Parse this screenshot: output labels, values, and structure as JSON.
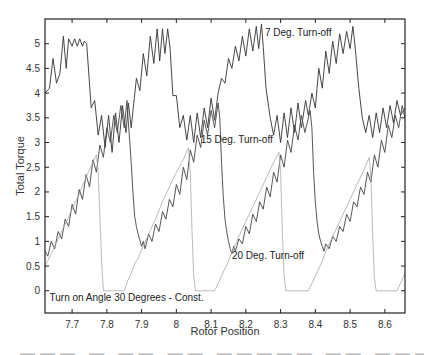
{
  "chart_data": {
    "type": "line",
    "title": "",
    "xlabel": "Rotor Position",
    "ylabel": "Total Torque",
    "xlim": [
      7.622,
      8.658
    ],
    "ylim": [
      -0.45,
      5.5
    ],
    "grid": false,
    "x_ticks": [
      7.7,
      7.8,
      7.9,
      8.0,
      8.1,
      8.2,
      8.3,
      8.4,
      8.5,
      8.6
    ],
    "x_tick_labels": [
      "7.7",
      "7.8",
      "7.9",
      "8",
      "8.1",
      "8.2",
      "8.3",
      "8.4",
      "8.5",
      "8.6"
    ],
    "y_ticks": [
      0,
      0.5,
      1,
      1.5,
      2,
      2.5,
      3,
      3.5,
      4,
      4.5,
      5
    ],
    "y_tick_labels": [
      "0",
      "0.5",
      "1",
      "1.5",
      "2",
      "2.5",
      "3",
      "3.5",
      "4",
      "4.5",
      "5"
    ],
    "annotations": [
      {
        "text": "7 Deg. Turn-off",
        "x": 8.255,
        "y": 5.15
      },
      {
        "text": "15 Deg. Turn-off",
        "x": 8.07,
        "y": 3.0
      },
      {
        "text": "20 Deg. Turn-off",
        "x": 8.16,
        "y": 0.65
      },
      {
        "text": "Turn on Angle 30 Degrees - Const.",
        "x": 7.635,
        "y": -0.2
      }
    ],
    "series": [
      {
        "name": "7 Deg. Turn-off",
        "color": "#333333",
        "width": 0.9,
        "period": 0.264,
        "description": "Periodic, rises with ripple to ~5.1-5.3 peak then drops to ~3.2 minimum",
        "points": [
          [
            7.622,
            4.0
          ],
          [
            7.635,
            4.1
          ],
          [
            7.645,
            4.7
          ],
          [
            7.655,
            4.2
          ],
          [
            7.665,
            4.4
          ],
          [
            7.675,
            5.15
          ],
          [
            7.683,
            4.5
          ],
          [
            7.69,
            5.1
          ],
          [
            7.7,
            4.95
          ],
          [
            7.707,
            5.1
          ],
          [
            7.715,
            4.95
          ],
          [
            7.722,
            5.1
          ],
          [
            7.73,
            4.95
          ],
          [
            7.735,
            5.05
          ],
          [
            7.742,
            5.0
          ],
          [
            7.755,
            3.7
          ],
          [
            7.765,
            3.85
          ],
          [
            7.775,
            3.15
          ],
          [
            7.785,
            3.55
          ],
          [
            7.795,
            2.9
          ],
          [
            7.805,
            3.55
          ],
          [
            7.815,
            2.8
          ],
          [
            7.825,
            3.6
          ],
          [
            7.835,
            3.0
          ],
          [
            7.845,
            3.75
          ],
          [
            7.855,
            3.2
          ],
          [
            7.862,
            3.8
          ],
          [
            7.87,
            3.3
          ],
          [
            7.885,
            4.3
          ],
          [
            7.895,
            4.05
          ],
          [
            7.905,
            4.8
          ],
          [
            7.915,
            4.35
          ],
          [
            7.925,
            5.15
          ],
          [
            7.935,
            4.6
          ],
          [
            7.945,
            5.3
          ],
          [
            7.952,
            4.65
          ],
          [
            7.96,
            5.3
          ],
          [
            7.967,
            4.8
          ],
          [
            7.975,
            5.3
          ],
          [
            7.982,
            4.9
          ],
          [
            7.99,
            3.95
          ],
          [
            8.0,
            3.95
          ],
          [
            8.01,
            3.3
          ],
          [
            8.02,
            3.55
          ],
          [
            8.03,
            3.05
          ],
          [
            8.04,
            3.55
          ],
          [
            8.05,
            3.0
          ],
          [
            8.06,
            3.6
          ],
          [
            8.07,
            3.1
          ],
          [
            8.08,
            3.7
          ],
          [
            8.09,
            3.3
          ],
          [
            8.1,
            3.9
          ],
          [
            8.11,
            3.45
          ],
          [
            8.12,
            4.0
          ],
          [
            8.13,
            4.3
          ],
          [
            8.14,
            4.2
          ],
          [
            8.15,
            4.7
          ],
          [
            8.16,
            4.5
          ],
          [
            8.17,
            4.95
          ],
          [
            8.18,
            4.65
          ],
          [
            8.19,
            5.15
          ],
          [
            8.2,
            4.75
          ],
          [
            8.21,
            5.3
          ],
          [
            8.22,
            4.85
          ],
          [
            8.23,
            5.35
          ],
          [
            8.237,
            4.9
          ],
          [
            8.245,
            5.4
          ],
          [
            8.25,
            4.95
          ],
          [
            8.258,
            4.1
          ],
          [
            8.27,
            3.5
          ],
          [
            8.28,
            3.15
          ],
          [
            8.29,
            3.55
          ],
          [
            8.3,
            3.0
          ],
          [
            8.31,
            3.6
          ],
          [
            8.32,
            3.1
          ],
          [
            8.33,
            3.7
          ],
          [
            8.34,
            3.2
          ],
          [
            8.35,
            3.8
          ],
          [
            8.36,
            3.3
          ],
          [
            8.372,
            3.85
          ],
          [
            8.38,
            3.55
          ],
          [
            8.39,
            4.0
          ],
          [
            8.4,
            3.7
          ],
          [
            8.41,
            4.5
          ],
          [
            8.42,
            4.1
          ],
          [
            8.43,
            4.85
          ],
          [
            8.44,
            4.4
          ],
          [
            8.45,
            5.05
          ],
          [
            8.46,
            4.6
          ],
          [
            8.47,
            5.2
          ],
          [
            8.48,
            4.8
          ],
          [
            8.49,
            5.25
          ],
          [
            8.5,
            4.9
          ],
          [
            8.508,
            5.35
          ],
          [
            8.515,
            4.9
          ],
          [
            8.525,
            4.1
          ],
          [
            8.535,
            3.5
          ],
          [
            8.545,
            3.2
          ],
          [
            8.555,
            3.55
          ],
          [
            8.565,
            3.1
          ],
          [
            8.575,
            3.6
          ],
          [
            8.585,
            3.2
          ],
          [
            8.595,
            3.7
          ],
          [
            8.605,
            3.3
          ],
          [
            8.615,
            3.75
          ],
          [
            8.625,
            3.4
          ],
          [
            8.635,
            3.85
          ],
          [
            8.645,
            3.55
          ],
          [
            8.658,
            3.7
          ]
        ]
      },
      {
        "name": "15 Deg. Turn-off",
        "color": "#444444",
        "width": 0.9,
        "period": 0.264,
        "description": "Periodic ramp from ~0.8 min to ~3.8 peak with ripple, then steep smooth drop",
        "points": [
          [
            7.622,
            0.8
          ],
          [
            7.63,
            0.7
          ],
          [
            7.64,
            1.0
          ],
          [
            7.65,
            0.85
          ],
          [
            7.66,
            1.2
          ],
          [
            7.67,
            1.05
          ],
          [
            7.68,
            1.45
          ],
          [
            7.69,
            1.3
          ],
          [
            7.7,
            1.75
          ],
          [
            7.71,
            1.55
          ],
          [
            7.72,
            2.05
          ],
          [
            7.73,
            1.85
          ],
          [
            7.74,
            2.35
          ],
          [
            7.75,
            2.1
          ],
          [
            7.76,
            2.65
          ],
          [
            7.77,
            2.4
          ],
          [
            7.78,
            2.95
          ],
          [
            7.79,
            2.7
          ],
          [
            7.8,
            3.3
          ],
          [
            7.81,
            3.0
          ],
          [
            7.82,
            3.55
          ],
          [
            7.83,
            3.2
          ],
          [
            7.84,
            3.75
          ],
          [
            7.85,
            3.3
          ],
          [
            7.858,
            3.85
          ],
          [
            7.86,
            3.6
          ],
          [
            7.87,
            2.6
          ],
          [
            7.875,
            2.0
          ],
          [
            7.88,
            1.5
          ],
          [
            7.885,
            1.3
          ],
          [
            7.89,
            1.15
          ],
          [
            7.9,
            0.9
          ],
          [
            7.905,
            1.0
          ],
          [
            7.91,
            0.85
          ],
          [
            7.92,
            1.15
          ],
          [
            7.93,
            1.0
          ],
          [
            7.94,
            1.35
          ],
          [
            7.95,
            1.2
          ],
          [
            7.96,
            1.6
          ],
          [
            7.97,
            1.45
          ],
          [
            7.98,
            1.85
          ],
          [
            7.99,
            1.7
          ],
          [
            8.0,
            2.15
          ],
          [
            8.01,
            1.95
          ],
          [
            8.02,
            2.5
          ],
          [
            8.03,
            2.25
          ],
          [
            8.04,
            2.85
          ],
          [
            8.05,
            2.6
          ],
          [
            8.06,
            3.15
          ],
          [
            8.07,
            2.9
          ],
          [
            8.08,
            3.45
          ],
          [
            8.09,
            3.15
          ],
          [
            8.1,
            3.65
          ],
          [
            8.11,
            3.3
          ],
          [
            8.12,
            3.8
          ],
          [
            8.125,
            3.5
          ],
          [
            8.13,
            2.6
          ],
          [
            8.135,
            1.9
          ],
          [
            8.14,
            1.45
          ],
          [
            8.145,
            1.2
          ],
          [
            8.15,
            1.0
          ],
          [
            8.155,
            0.85
          ],
          [
            8.16,
            0.75
          ],
          [
            8.165,
            0.9
          ],
          [
            8.17,
            0.8
          ],
          [
            8.18,
            1.05
          ],
          [
            8.19,
            0.95
          ],
          [
            8.2,
            1.3
          ],
          [
            8.21,
            1.15
          ],
          [
            8.22,
            1.55
          ],
          [
            8.23,
            1.4
          ],
          [
            8.24,
            1.8
          ],
          [
            8.25,
            1.65
          ],
          [
            8.26,
            2.1
          ],
          [
            8.27,
            1.9
          ],
          [
            8.28,
            2.4
          ],
          [
            8.29,
            2.2
          ],
          [
            8.3,
            2.75
          ],
          [
            8.31,
            2.5
          ],
          [
            8.32,
            3.05
          ],
          [
            8.33,
            2.8
          ],
          [
            8.34,
            3.35
          ],
          [
            8.35,
            3.05
          ],
          [
            8.36,
            3.55
          ],
          [
            8.37,
            3.2
          ],
          [
            8.385,
            3.65
          ],
          [
            8.39,
            3.3
          ],
          [
            8.395,
            2.4
          ],
          [
            8.4,
            1.8
          ],
          [
            8.405,
            1.4
          ],
          [
            8.41,
            1.15
          ],
          [
            8.415,
            1.0
          ],
          [
            8.42,
            0.9
          ],
          [
            8.425,
            0.8
          ],
          [
            8.43,
            0.95
          ],
          [
            8.44,
            0.85
          ],
          [
            8.45,
            1.1
          ],
          [
            8.46,
            1.0
          ],
          [
            8.47,
            1.3
          ],
          [
            8.48,
            1.2
          ],
          [
            8.49,
            1.55
          ],
          [
            8.5,
            1.4
          ],
          [
            8.51,
            1.8
          ],
          [
            8.52,
            1.7
          ],
          [
            8.53,
            2.1
          ],
          [
            8.54,
            1.95
          ],
          [
            8.55,
            2.4
          ],
          [
            8.56,
            2.2
          ],
          [
            8.57,
            2.75
          ],
          [
            8.58,
            2.5
          ],
          [
            8.59,
            3.05
          ],
          [
            8.6,
            2.8
          ],
          [
            8.61,
            3.35
          ],
          [
            8.62,
            3.1
          ],
          [
            8.63,
            3.55
          ],
          [
            8.64,
            3.3
          ],
          [
            8.65,
            3.75
          ],
          [
            8.658,
            3.5
          ]
        ]
      },
      {
        "name": "20 Deg. Turn-off",
        "color": "#aaaaaa",
        "width": 0.8,
        "period": 0.264,
        "description": "Light grey: ramp with ripple then steep drop to 0, flat zero, then stepped rise",
        "points": [
          [
            7.622,
            0.5
          ],
          [
            7.64,
            0.75
          ],
          [
            7.66,
            1.05
          ],
          [
            7.68,
            1.35
          ],
          [
            7.7,
            1.65
          ],
          [
            7.72,
            1.95
          ],
          [
            7.74,
            2.3
          ],
          [
            7.76,
            2.6
          ],
          [
            7.77,
            2.75
          ],
          [
            7.775,
            2.4
          ],
          [
            7.78,
            1.5
          ],
          [
            7.785,
            0.6
          ],
          [
            7.79,
            0.0
          ],
          [
            7.85,
            0.0
          ],
          [
            7.86,
            0.2
          ],
          [
            7.87,
            0.35
          ],
          [
            7.875,
            0.45
          ],
          [
            7.88,
            0.55
          ],
          [
            7.89,
            0.65
          ],
          [
            7.895,
            0.75
          ],
          [
            7.905,
            0.9
          ],
          [
            7.92,
            1.15
          ],
          [
            7.94,
            1.45
          ],
          [
            7.96,
            1.8
          ],
          [
            7.98,
            2.1
          ],
          [
            8.0,
            2.4
          ],
          [
            8.02,
            2.65
          ],
          [
            8.035,
            2.9
          ],
          [
            8.04,
            2.4
          ],
          [
            8.045,
            1.2
          ],
          [
            8.05,
            0.3
          ],
          [
            8.055,
            0.0
          ],
          [
            8.11,
            0.0
          ],
          [
            8.12,
            0.15
          ],
          [
            8.13,
            0.3
          ],
          [
            8.14,
            0.45
          ],
          [
            8.15,
            0.6
          ],
          [
            8.155,
            0.7
          ],
          [
            8.165,
            0.85
          ],
          [
            8.18,
            1.1
          ],
          [
            8.2,
            1.4
          ],
          [
            8.22,
            1.7
          ],
          [
            8.24,
            2.0
          ],
          [
            8.26,
            2.3
          ],
          [
            8.28,
            2.6
          ],
          [
            8.295,
            2.8
          ],
          [
            8.3,
            2.4
          ],
          [
            8.305,
            1.2
          ],
          [
            8.31,
            0.3
          ],
          [
            8.315,
            0.0
          ],
          [
            8.38,
            0.0
          ],
          [
            8.39,
            0.15
          ],
          [
            8.4,
            0.3
          ],
          [
            8.41,
            0.45
          ],
          [
            8.42,
            0.6
          ],
          [
            8.425,
            0.7
          ],
          [
            8.44,
            0.95
          ],
          [
            8.46,
            1.25
          ],
          [
            8.48,
            1.55
          ],
          [
            8.5,
            1.85
          ],
          [
            8.52,
            2.15
          ],
          [
            8.54,
            2.45
          ],
          [
            8.555,
            2.7
          ],
          [
            8.56,
            2.3
          ],
          [
            8.565,
            1.1
          ],
          [
            8.57,
            0.25
          ],
          [
            8.575,
            0.0
          ],
          [
            8.635,
            0.0
          ],
          [
            8.645,
            0.15
          ],
          [
            8.658,
            0.35
          ]
        ]
      }
    ]
  },
  "caption": {
    "text": "Figure 4.12: Torque ... (partially cropped)"
  }
}
